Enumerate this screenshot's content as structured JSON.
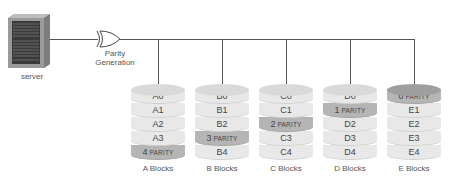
{
  "server": {
    "label": "server",
    "icon": "server-rack-icon"
  },
  "gate": {
    "label_line1": "Parity",
    "label_line2": "Generation",
    "icon": "xor-gate-icon"
  },
  "colors": {
    "disk_light": "#e8e8e8",
    "disk_top_light": "#d9d9d9",
    "parity_fill": "#b5b5b5",
    "parity_top": "#9e9e9e",
    "line": "#555555"
  },
  "stacks": [
    {
      "label": "A Blocks",
      "rows": [
        {
          "num": "A0",
          "parity": false
        },
        {
          "num": "A1",
          "parity": false
        },
        {
          "num": "A2",
          "parity": false
        },
        {
          "num": "A3",
          "parity": false
        },
        {
          "num": "4",
          "suffix": "PARITY",
          "parity": true
        }
      ]
    },
    {
      "label": "B Blocks",
      "rows": [
        {
          "num": "B0",
          "parity": false
        },
        {
          "num": "B1",
          "parity": false
        },
        {
          "num": "B2",
          "parity": false
        },
        {
          "num": "3",
          "suffix": "PARITY",
          "parity": true
        },
        {
          "num": "B4",
          "parity": false
        }
      ]
    },
    {
      "label": "C Blocks",
      "rows": [
        {
          "num": "C0",
          "parity": false
        },
        {
          "num": "C1",
          "parity": false
        },
        {
          "num": "2",
          "suffix": "PARITY",
          "parity": true
        },
        {
          "num": "C3",
          "parity": false
        },
        {
          "num": "C4",
          "parity": false
        }
      ]
    },
    {
      "label": "D Blocks",
      "rows": [
        {
          "num": "D0",
          "parity": false
        },
        {
          "num": "1",
          "suffix": "PARITY",
          "parity": true
        },
        {
          "num": "D2",
          "parity": false
        },
        {
          "num": "D3",
          "parity": false
        },
        {
          "num": "D4",
          "parity": false
        }
      ]
    },
    {
      "label": "E Blocks",
      "rows": [
        {
          "num": "0",
          "suffix": "PARITY",
          "parity": true
        },
        {
          "num": "E1",
          "parity": false
        },
        {
          "num": "E2",
          "parity": false
        },
        {
          "num": "E3",
          "parity": false
        },
        {
          "num": "E4",
          "parity": false
        }
      ]
    }
  ]
}
